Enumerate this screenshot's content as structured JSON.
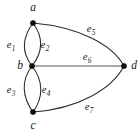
{
  "figure": {
    "kind": "undirected-multigraph",
    "background_color": "#ffffff",
    "edge_color": "#2b2b2b",
    "vertex_color": "#111111",
    "width": 140,
    "height": 134
  },
  "vertices": [
    {
      "id": "a",
      "label": "a",
      "cx": 33,
      "cy": 23,
      "label_x": 33,
      "label_y": 8,
      "r": 2.6
    },
    {
      "id": "b",
      "label": "b",
      "cx": 32,
      "cy": 66,
      "label_x": 20,
      "label_y": 66,
      "r": 2.6
    },
    {
      "id": "c",
      "label": "c",
      "cx": 33,
      "cy": 112,
      "label_x": 33,
      "label_y": 126,
      "r": 2.6
    },
    {
      "id": "d",
      "label": "d",
      "cx": 124,
      "cy": 66,
      "label_x": 134,
      "label_y": 66,
      "r": 2.6
    }
  ],
  "edges": [
    {
      "id": "e1",
      "name": "e",
      "sub": "1",
      "from": "a",
      "to": "b",
      "kind": "curve",
      "bulge": "left",
      "label_x": 11,
      "label_y": 45
    },
    {
      "id": "e2",
      "name": "e",
      "sub": "2",
      "from": "a",
      "to": "b",
      "kind": "curve",
      "bulge": "right",
      "label_x": 45,
      "label_y": 45
    },
    {
      "id": "e3",
      "name": "e",
      "sub": "3",
      "from": "b",
      "to": "c",
      "kind": "curve",
      "bulge": "left",
      "label_x": 11,
      "label_y": 90
    },
    {
      "id": "e4",
      "name": "e",
      "sub": "4",
      "from": "b",
      "to": "c",
      "kind": "curve",
      "bulge": "right",
      "label_x": 46,
      "label_y": 90
    },
    {
      "id": "e5",
      "name": "e",
      "sub": "5",
      "from": "a",
      "to": "d",
      "kind": "curve",
      "bulge": "up",
      "label_x": 91,
      "label_y": 29
    },
    {
      "id": "e6",
      "name": "e",
      "sub": "6",
      "from": "b",
      "to": "d",
      "kind": "straight",
      "bulge": "none",
      "label_x": 87,
      "label_y": 57
    },
    {
      "id": "e7",
      "name": "e",
      "sub": "7",
      "from": "c",
      "to": "d",
      "kind": "curve",
      "bulge": "down",
      "label_x": 89,
      "label_y": 107
    }
  ],
  "geometry": {
    "paths": {
      "e1": "M 33 23 C 22 38, 21 52, 32 66",
      "e2": "M 33 23 C 44 38, 43 52, 32 66",
      "e3": "M 32 66 C 21 80, 22 97, 33 112",
      "e4": "M 32 66 C 43 80, 44 97, 33 112",
      "e5": "M 33 23 C 78 27, 112 44, 124 66",
      "e6": "M 32 66 L 124 66",
      "e7": "M 33 112 C 78 109, 112 89, 124 66"
    }
  }
}
